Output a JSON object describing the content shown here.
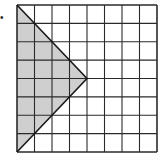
{
  "diagram": {
    "label": "•",
    "grid": {
      "rows": 8,
      "cols": 8,
      "x": 17,
      "y": 5,
      "width": 140,
      "height": 147
    },
    "shape": {
      "type": "triangle",
      "vertices_grid": [
        [
          0,
          0
        ],
        [
          0,
          8
        ],
        [
          4,
          4
        ]
      ],
      "fill": "#cfcfcf",
      "stroke": "#1a1a1a"
    },
    "colors": {
      "grid_line": "#2a2a2a",
      "background": "#ffffff"
    }
  }
}
